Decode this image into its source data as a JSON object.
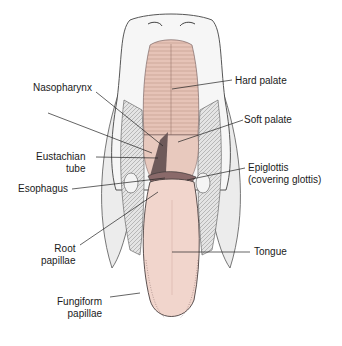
{
  "diagram": {
    "colors": {
      "palate_pink": "#e6c3b7",
      "tongue_pink": "#f1d5cc",
      "tissue_outline": "#4a4040",
      "lateral_gray": "#e8e8e8",
      "leader_line": "#222222",
      "background": "#ffffff"
    },
    "labels_left": [
      {
        "id": "nasopharynx",
        "lines": [
          "Nasopharynx"
        ]
      },
      {
        "id": "eustachian-tube",
        "lines": [
          "Eustachian",
          "tube"
        ]
      },
      {
        "id": "esophagus",
        "lines": [
          "Esophagus"
        ]
      },
      {
        "id": "root-papillae",
        "lines": [
          "Root",
          "papillae"
        ]
      },
      {
        "id": "fungiform-papillae",
        "lines": [
          "Fungiform",
          "papillae"
        ]
      }
    ],
    "labels_right": [
      {
        "id": "hard-palate",
        "lines": [
          "Hard palate"
        ]
      },
      {
        "id": "soft-palate",
        "lines": [
          "Soft palate"
        ]
      },
      {
        "id": "epiglottis",
        "lines": [
          "Epiglottis",
          "(covering glottis)"
        ]
      },
      {
        "id": "tongue",
        "lines": [
          "Tongue"
        ]
      }
    ]
  }
}
